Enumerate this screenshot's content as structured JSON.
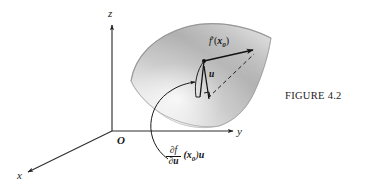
{
  "figure": {
    "caption": "FIGURE 4.2",
    "axes": {
      "z_label": "z",
      "y_label": "y",
      "x_label": "x",
      "origin_label": "O"
    },
    "annotations": {
      "derivative_numerator": "∂f",
      "derivative_denominator": "∂u",
      "derivative_tail_point": "(x",
      "derivative_tail_sub": "0",
      "derivative_tail_close": ")",
      "derivative_tail_vector": "u",
      "tangent_vector_label": "u",
      "differential_prefix": "f",
      "differential_prime": "′",
      "differential_open": "(",
      "differential_point": "x",
      "differential_sub": "0",
      "differential_close": ")"
    },
    "colors": {
      "ink": "#111111",
      "axis": "#2a2a2a",
      "surface_light": "#efefef",
      "surface_mid": "#bdbdbd",
      "surface_dark": "#9a9a9a",
      "background": "#ffffff"
    }
  }
}
